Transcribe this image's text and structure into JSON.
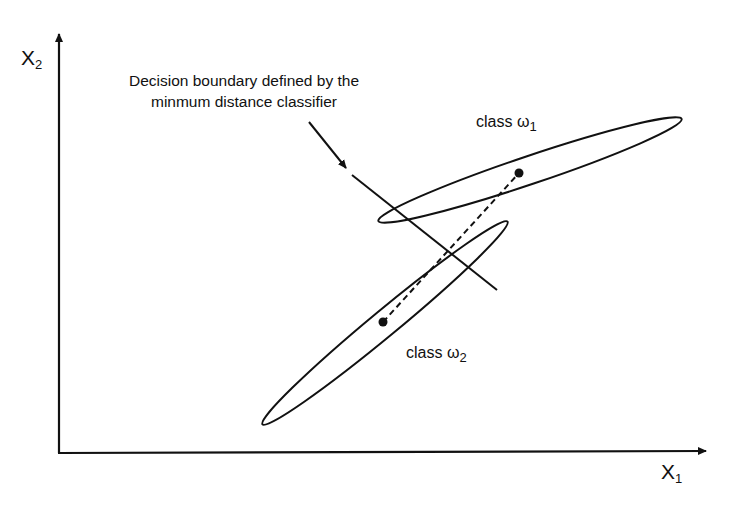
{
  "figure": {
    "type": "diagram",
    "axes": {
      "x_label": "X",
      "x_sub": "1",
      "y_label": "X",
      "y_sub": "2"
    },
    "annotation": {
      "line1": "Decision boundary defined by the",
      "line2": "minmum distance classifier"
    },
    "classes": [
      {
        "label": "class ω",
        "sub": "1",
        "mean": [
          519,
          173
        ],
        "ellipse": {
          "cx": 530,
          "cy": 170,
          "rx": 160,
          "ry": 14,
          "angle": -18.6
        }
      },
      {
        "label": "class ω",
        "sub": "2",
        "mean": [
          383,
          322
        ],
        "ellipse": {
          "cx": 385,
          "cy": 323,
          "rx": 159,
          "ry": 13,
          "angle": -39.6
        }
      }
    ],
    "line_color": "#111111",
    "background": "#ffffff"
  }
}
